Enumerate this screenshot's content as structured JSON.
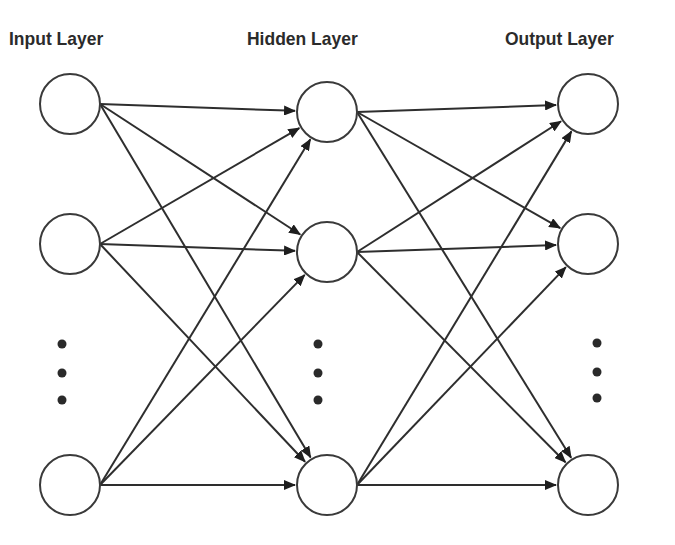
{
  "diagram": {
    "title_labels": {
      "input": "Input Layer",
      "hidden": "Hidden Layer",
      "output": "Output Layer"
    },
    "layers": [
      {
        "name": "input",
        "label": "Input Layer",
        "nodes": [
          {
            "id": "i1",
            "cx": 70,
            "cy": 104
          },
          {
            "id": "i2",
            "cx": 70,
            "cy": 244
          },
          {
            "id": "i3",
            "cx": 70,
            "cy": 485
          }
        ],
        "ellipsis": {
          "x": 62,
          "ys": [
            344,
            373,
            400
          ]
        }
      },
      {
        "name": "hidden",
        "label": "Hidden Layer",
        "nodes": [
          {
            "id": "h1",
            "cx": 327,
            "cy": 112
          },
          {
            "id": "h2",
            "cx": 327,
            "cy": 252
          },
          {
            "id": "h3",
            "cx": 327,
            "cy": 485
          }
        ],
        "ellipsis": {
          "x": 318,
          "ys": [
            344,
            373,
            400
          ]
        }
      },
      {
        "name": "output",
        "label": "Output Layer",
        "nodes": [
          {
            "id": "o1",
            "cx": 588,
            "cy": 104
          },
          {
            "id": "o2",
            "cx": 588,
            "cy": 244
          },
          {
            "id": "o3",
            "cx": 588,
            "cy": 485
          }
        ],
        "ellipsis": {
          "x": 597,
          "ys": [
            343,
            372,
            398
          ]
        }
      }
    ],
    "node_radius": 30,
    "connections": "fully-connected",
    "colors": {
      "stroke": "#2e2e2e",
      "node_fill": "#ffffff",
      "text": "#2b2b2b",
      "background": "#ffffff"
    }
  }
}
